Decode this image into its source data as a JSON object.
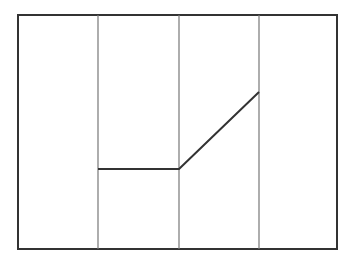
{
  "diagram": {
    "width": 341,
    "height": 259,
    "frame": {
      "x": 18,
      "y": 15,
      "w": 319,
      "h": 234,
      "stroke": "#333333",
      "stroke_width": 2
    },
    "dividers": [
      {
        "x": 98
      },
      {
        "x": 179
      },
      {
        "x": 259
      }
    ],
    "divider_style": {
      "stroke": "#777777",
      "stroke_width": 1.2
    },
    "polyline": {
      "points": [
        [
          98,
          169
        ],
        [
          179,
          169
        ],
        [
          259,
          92
        ]
      ],
      "stroke": "#333333",
      "stroke_width": 2
    }
  }
}
